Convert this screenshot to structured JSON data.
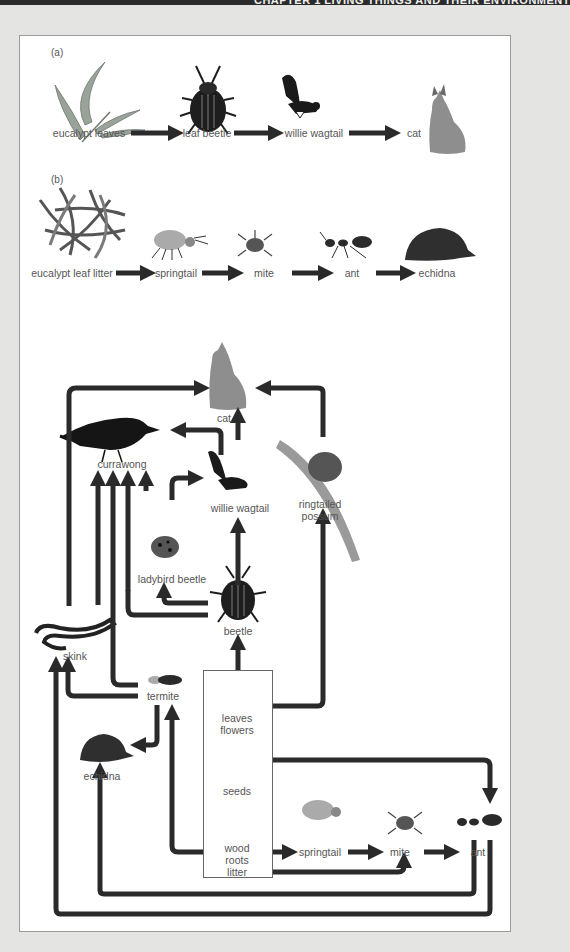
{
  "header": {
    "text": "CHAPTER 1 LIVING THINGS AND THEIR ENVIRONMENT"
  },
  "chain_a": {
    "label": "(a)",
    "nodes": [
      "eucalypt leaves",
      "leaf beetle",
      "willie wagtail",
      "cat"
    ]
  },
  "chain_b": {
    "label": "(b)",
    "nodes": [
      "eucalypt leaf litter",
      "springtail",
      "mite",
      "ant",
      "echidna"
    ]
  },
  "web": {
    "organisms": {
      "cat": "cat",
      "currawong": "currawong",
      "willie_wagtail": "willie wagtail",
      "ringtailed_possum": "ringtailed\npossum",
      "ladybird_beetle": "ladybird beetle",
      "beetle": "beetle",
      "skink": "skink",
      "termite": "termite",
      "echidna": "echidna",
      "springtail": "springtail",
      "mite": "mite",
      "ant": "ant"
    },
    "producers": {
      "leaves_flowers": "leaves\nflowers",
      "seeds": "seeds",
      "wood_roots_litter": "wood\nroots\nlitter"
    },
    "links": [
      [
        "skink",
        "cat"
      ],
      [
        "willie wagtail",
        "cat"
      ],
      [
        "ringtailed possum",
        "cat"
      ],
      [
        "willie wagtail",
        "currawong"
      ],
      [
        "skink",
        "currawong"
      ],
      [
        "ladybird beetle",
        "currawong"
      ],
      [
        "beetle",
        "currawong"
      ],
      [
        "termite",
        "currawong"
      ],
      [
        "beetle",
        "willie wagtail"
      ],
      [
        "beetle",
        "ladybird beetle"
      ],
      [
        "leaves flowers",
        "beetle"
      ],
      [
        "leaves flowers",
        "ringtailed possum"
      ],
      [
        "termite",
        "skink"
      ],
      [
        "ant",
        "skink"
      ],
      [
        "termite",
        "echidna"
      ],
      [
        "ant",
        "echidna"
      ],
      [
        "wood roots litter",
        "termite"
      ],
      [
        "wood roots litter",
        "springtail"
      ],
      [
        "springtail",
        "mite"
      ],
      [
        "wood roots litter",
        "mite"
      ],
      [
        "mite",
        "ant"
      ],
      [
        "seeds",
        "ant"
      ]
    ]
  },
  "colors": {
    "arrow": "#2a2a2a",
    "text": "#555555",
    "background": "#e4e4e2",
    "panel": "#ffffff"
  }
}
